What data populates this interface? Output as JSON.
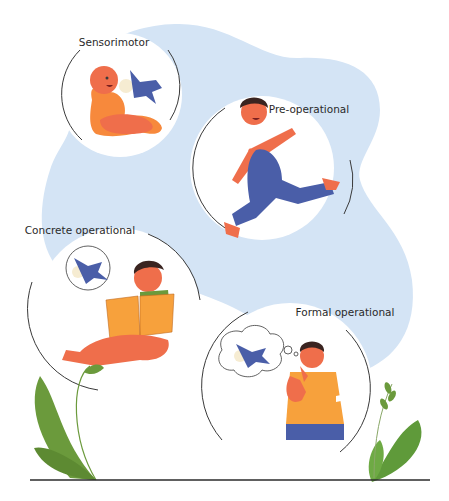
{
  "colors": {
    "background": "#ffffff",
    "blob": "#d4e4f5",
    "bubble": "#ffffff",
    "outline": "#3a3a3a",
    "skin": "#ef6e4b",
    "orange": "#f7a13c",
    "blue": "#4a5ea8",
    "green": "#6b9a3c",
    "ground": "#2b2b2b"
  },
  "stages": [
    {
      "label": "Sensorimotor",
      "figure": "baby-with-toy-plane"
    },
    {
      "label": "Pre-operational",
      "figure": "running-child"
    },
    {
      "label": "Concrete operational",
      "figure": "child-reading-book-thinking-of-plane"
    },
    {
      "label": "Formal operational",
      "figure": "adult-imagining-plane"
    }
  ]
}
